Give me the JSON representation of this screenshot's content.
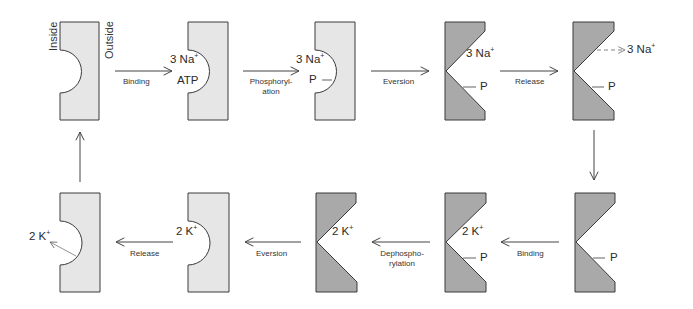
{
  "colors": {
    "light_fill": "#e6e6e6",
    "dark_fill": "#a9a9a9",
    "stroke": "#3a3a3a",
    "arrow": "#555555",
    "text": "#2a2a2a"
  },
  "orientation": {
    "inside_label": "Inside",
    "outside_label": "Outside"
  },
  "top_row": {
    "states": [
      {
        "id": "s1",
        "shape": "inward-open-empty",
        "labels": []
      },
      {
        "id": "s2",
        "shape": "inward-open",
        "labels": [
          "3 Na+",
          "ATP"
        ]
      },
      {
        "id": "s3",
        "shape": "inward-open",
        "labels": [
          "3 Na+",
          "P"
        ]
      },
      {
        "id": "s4",
        "shape": "outward-open",
        "labels": [
          "3 Na+",
          "P"
        ]
      },
      {
        "id": "s5",
        "shape": "outward-open",
        "labels": [
          "3 Na+ (released)",
          "P"
        ]
      }
    ],
    "transitions": [
      {
        "label": "Binding"
      },
      {
        "label_line1": "Phosphoryl-",
        "label_line2": "ation"
      },
      {
        "label": "Eversion"
      },
      {
        "label": "Release"
      }
    ]
  },
  "bottom_row": {
    "states": [
      {
        "id": "b5",
        "shape": "outward-open",
        "labels": [
          "P"
        ]
      },
      {
        "id": "b4",
        "shape": "outward-open",
        "labels": [
          "2 K+",
          "P"
        ]
      },
      {
        "id": "b3",
        "shape": "outward-open",
        "labels": [
          "2 K+"
        ]
      },
      {
        "id": "b2",
        "shape": "inward-open",
        "labels": [
          "2 K+"
        ]
      },
      {
        "id": "b1",
        "shape": "inward-open-empty",
        "labels": [
          "2 K+ (released)"
        ]
      }
    ],
    "transitions": [
      {
        "label": "Binding"
      },
      {
        "label_line1": "Dephospho-",
        "label_line2": "rylation"
      },
      {
        "label": "Eversion"
      },
      {
        "label": "Release"
      }
    ]
  },
  "text": {
    "na3": "3 Na",
    "k2": "2 K",
    "plus": "+",
    "atp": "ATP",
    "p": "P",
    "binding": "Binding",
    "phos1": "Phosphoryl-",
    "phos2": "ation",
    "eversion": "Eversion",
    "release": "Release",
    "dephos1": "Dephospho-",
    "dephos2": "rylation"
  }
}
